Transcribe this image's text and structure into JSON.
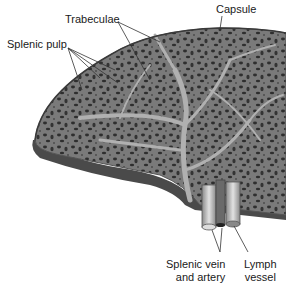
{
  "diagram": {
    "labels": {
      "capsule": "Capsule",
      "trabeculae": "Trabeculae",
      "splenic_pulp": "Splenic pulp",
      "splenic_vein_artery_line1": "Splenic vein",
      "splenic_vein_artery_line2": "and artery",
      "lymph_vessel_line1": "Lymph",
      "lymph_vessel_line2": "vessel"
    },
    "colors": {
      "tissue": "#7a7a7a",
      "tissue_dark": "#4a4a4a",
      "trabecula": "#a8a8a8",
      "hole": "#2e2e2e",
      "vessel": "#c8c8c8",
      "edge": "#555555",
      "leader_line": "#333333"
    }
  }
}
